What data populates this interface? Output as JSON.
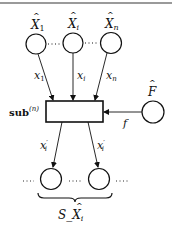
{
  "diagram": {
    "top_rule_color": "#9a9a9a",
    "stroke_color": "#111111",
    "input_nodes": [
      {
        "label_base": "X",
        "label_sub": "1",
        "hat": true
      },
      {
        "label_base": "X",
        "label_sub": "i",
        "hat": true
      },
      {
        "label_base": "X",
        "label_sub": "n",
        "hat": true
      }
    ],
    "input_ellipsis": "⋯",
    "edges_in": [
      {
        "label_base": "x",
        "label_sub": "1"
      },
      {
        "label_base": "x",
        "label_sub": "i"
      },
      {
        "label_base": "x",
        "label_sub": "n"
      }
    ],
    "box": {
      "label_bold": "sub",
      "label_sup": "(n)"
    },
    "side_node": {
      "label_base": "F",
      "hat": true
    },
    "side_edge_label": "f",
    "edges_out": [
      {
        "label_base": "x",
        "label_sub": "i",
        "prime": "′"
      },
      {
        "label_base": "x",
        "label_sub": "i",
        "prime": "′"
      }
    ],
    "output_ellipsis": "⋯",
    "brace_label": {
      "prefix": "S_",
      "base": "X",
      "sub": "i",
      "hat": true
    }
  }
}
